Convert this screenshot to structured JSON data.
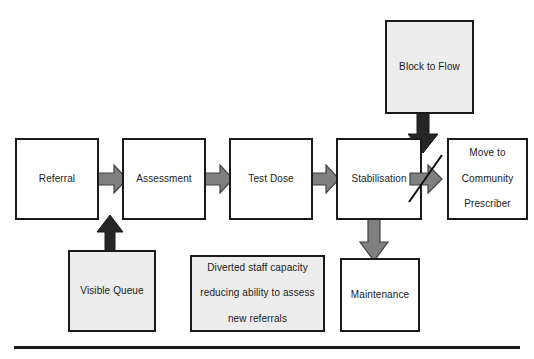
{
  "diagram": {
    "nodes": [
      {
        "id": "referral",
        "label": "Referral",
        "fill": "white"
      },
      {
        "id": "assessment",
        "label": "Assessment",
        "fill": "white"
      },
      {
        "id": "test-dose",
        "label": "Test Dose",
        "fill": "white"
      },
      {
        "id": "stabilisation",
        "label": "Stabilisation",
        "fill": "white"
      },
      {
        "id": "move-to-community-prescriber",
        "label_line1": "Move to",
        "label_line2": "Community",
        "label_line3": "Prescriber",
        "fill": "white"
      },
      {
        "id": "block-to-flow",
        "label": "Block to Flow",
        "fill": "gray"
      },
      {
        "id": "visible-queue",
        "label": "Visible Queue",
        "fill": "gray"
      },
      {
        "id": "diverted-staff-capacity",
        "label_line1": "Diverted staff capacity",
        "label_line2": "reducing ability to assess",
        "label_line3": "new referrals",
        "fill": "gray"
      },
      {
        "id": "maintenance",
        "label": "Maintenance",
        "fill": "white"
      }
    ],
    "edges": [
      {
        "id": "referral-to-assessment",
        "style": "gray-right"
      },
      {
        "id": "assessment-to-test-dose",
        "style": "gray-right"
      },
      {
        "id": "test-dose-to-stabilisation",
        "style": "gray-right"
      },
      {
        "id": "stabilisation-to-move",
        "style": "gray-right-blocked"
      },
      {
        "id": "block-to-flow-down",
        "style": "black-down"
      },
      {
        "id": "visible-queue-up",
        "style": "black-up"
      },
      {
        "id": "stabilisation-to-maintenance",
        "style": "gray-down"
      }
    ],
    "colors": {
      "outline": "#1a1a1a",
      "gray_fill": "#ededed",
      "white_fill": "#ffffff",
      "gray_arrow": "#808080",
      "gray_arrow_outline": "#404040",
      "black_arrow": "#262626",
      "block_mark": "#111111",
      "rule": "#1a1a1a"
    },
    "footer_rule": "horizontal-divider"
  }
}
